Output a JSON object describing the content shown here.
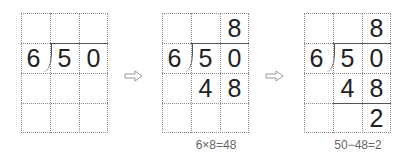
{
  "steps": [
    {
      "divisor": "6",
      "dividend": [
        "5",
        "0"
      ],
      "quotient": [
        "",
        "",
        ""
      ],
      "product": [
        "",
        "",
        ""
      ],
      "remainder": [
        "",
        "",
        ""
      ],
      "caption": ""
    },
    {
      "divisor": "6",
      "dividend": [
        "5",
        "0"
      ],
      "quotient": [
        "",
        "",
        "8"
      ],
      "product": [
        "",
        "4",
        "8"
      ],
      "remainder": [
        "",
        "",
        ""
      ],
      "caption": "6×8=48"
    },
    {
      "divisor": "6",
      "dividend": [
        "5",
        "0"
      ],
      "quotient": [
        "",
        "",
        "8"
      ],
      "product": [
        "",
        "4",
        "8"
      ],
      "remainder": [
        "",
        "",
        "2"
      ],
      "caption": "50−48=2"
    }
  ],
  "arrows": [
    "⇨",
    "⇨"
  ]
}
